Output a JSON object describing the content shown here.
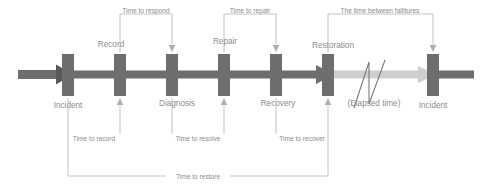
{
  "diagram": {
    "colors": {
      "bar": "#6e6e6e",
      "axis": "#6e6e6e",
      "axis_faded": "#cfcfcf",
      "text": "#8c8c8c",
      "bracket": "#b0b0b0",
      "background": "#ffffff"
    },
    "milestones": [
      {
        "id": "incident-start",
        "label": "Incident",
        "x": 68,
        "label_position": "below"
      },
      {
        "id": "record",
        "label": "Record",
        "x": 120,
        "label_position": "above"
      },
      {
        "id": "diagnosis",
        "label": "Diagnosis",
        "x": 172,
        "label_position": "below"
      },
      {
        "id": "repair",
        "label": "Repair",
        "x": 224,
        "label_position": "above"
      },
      {
        "id": "recovery",
        "label": "Recovery",
        "x": 276,
        "label_position": "below"
      },
      {
        "id": "restoration",
        "label": "Restoration",
        "x": 328,
        "label_position": "above"
      },
      {
        "id": "incident-next",
        "label": "Incident",
        "x": 433,
        "label_position": "below"
      }
    ],
    "gap_label": "(Elapsed time)",
    "top_measures": [
      {
        "id": "time-to-respond",
        "label": "Time to respond",
        "from": 68,
        "to": 172,
        "y": 17
      },
      {
        "id": "time-to-repair",
        "label": "Time to repair",
        "from": 224,
        "to": 276,
        "y": 17
      },
      {
        "id": "time-between",
        "label": "The time between failitures",
        "from": 328,
        "to": 433,
        "y": 17
      }
    ],
    "bottom_measures": [
      {
        "id": "time-to-record",
        "label": "Time to record",
        "from": 68,
        "to": 120,
        "y": 137
      },
      {
        "id": "time-to-resolve",
        "label": "Time to resolve",
        "from": 172,
        "to": 224,
        "y": 137
      },
      {
        "id": "time-to-recover",
        "label": "Time to recover",
        "from": 276,
        "to": 328,
        "y": 137
      },
      {
        "id": "time-to-restore",
        "label": "Time to restore",
        "from": 68,
        "to": 328,
        "y": 177
      }
    ]
  }
}
